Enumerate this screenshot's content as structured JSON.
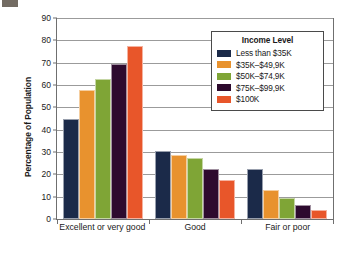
{
  "chart_data": {
    "type": "bar",
    "title": "",
    "xlabel": "",
    "ylabel": "Percentage of Population",
    "ylim": [
      0,
      90
    ],
    "ytick_step": 10,
    "yticks": [
      "90",
      "80",
      "70",
      "60",
      "50",
      "40",
      "30",
      "20",
      "10",
      "0"
    ],
    "grid": "horizontal",
    "legend_position": "upper-right",
    "legend_title": "Income Level",
    "categories": [
      "Excellent or very good",
      "Good",
      "Fair or poor"
    ],
    "series": [
      {
        "name": "Less than $35K",
        "color": "#1b2a49",
        "values": [
          45,
          30.5,
          22.2
        ]
      },
      {
        "name": "$35K–$49,9K",
        "color": "#e8922e",
        "values": [
          57.8,
          28.5,
          13.2
        ]
      },
      {
        "name": "$50K–$74,9K",
        "color": "#7fa536",
        "values": [
          62.6,
          27.4,
          9.4
        ]
      },
      {
        "name": "$75K–$99,9K",
        "color": "#2d0a2e",
        "values": [
          69.6,
          22.4,
          6.4
        ]
      },
      {
        "name": "$100K",
        "color": "#e8562a",
        "values": [
          77.4,
          17.3,
          4.1
        ]
      }
    ]
  },
  "axis": {
    "y_title": "Percentage of Population"
  },
  "legend": {
    "title": "Income Level",
    "items": [
      {
        "label": "Less than $35K",
        "color": "#1b2a49"
      },
      {
        "label": "$35K–$49,9K",
        "color": "#e8922e"
      },
      {
        "label": "$50K–$74,9K",
        "color": "#7fa536"
      },
      {
        "label": "$75K–$99,9K",
        "color": "#2d0a2e"
      },
      {
        "label": "$100K",
        "color": "#e8562a"
      }
    ]
  }
}
